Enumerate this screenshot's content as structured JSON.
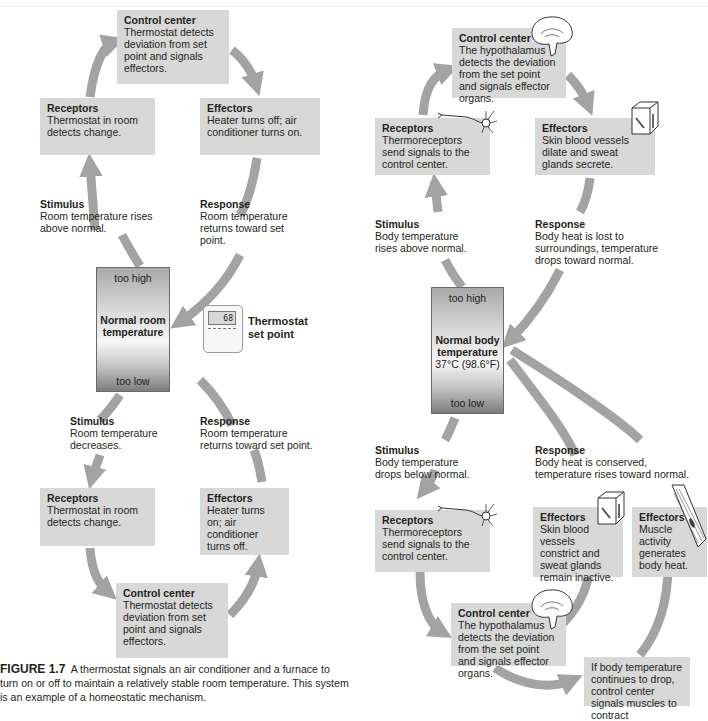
{
  "left_diagram": {
    "top_loop": {
      "control_center": {
        "title": "Control center",
        "text": "Thermostat detects deviation from set point and signals effectors."
      },
      "receptors": {
        "title": "Receptors",
        "text": "Thermostat in room detects change."
      },
      "effectors": {
        "title": "Effectors",
        "text": "Heater turns off; air conditioner turns on."
      },
      "stimulus": {
        "title": "Stimulus",
        "text": "Room temperature rises above normal."
      },
      "response": {
        "title": "Response",
        "text": "Room temperature returns toward set point."
      }
    },
    "gauge": {
      "high": "too high",
      "label_line1": "Normal room",
      "label_line2": "temperature",
      "low": "too low"
    },
    "setpoint": {
      "display": "68",
      "label_line1": "Thermostat",
      "label_line2": "set point"
    },
    "bottom_loop": {
      "stimulus": {
        "title": "Stimulus",
        "text": "Room temperature decreases."
      },
      "response": {
        "title": "Response",
        "text": "Room temperature returns toward set point."
      },
      "receptors": {
        "title": "Receptors",
        "text": "Thermostat in room detects change."
      },
      "effectors": {
        "title": "Effectors",
        "text": "Heater turns on; air conditioner turns off."
      },
      "control_center": {
        "title": "Control center",
        "text": "Thermostat detects deviation from set point and signals effectors."
      }
    }
  },
  "right_diagram": {
    "top_loop": {
      "control_center": {
        "title": "Control center",
        "text": "The hypothalamus detects the deviation from the set point and signals effector organs."
      },
      "receptors": {
        "title": "Receptors",
        "text": "Thermoreceptors send signals to the control center."
      },
      "effectors": {
        "title": "Effectors",
        "text": "Skin blood vessels dilate and sweat glands secrete."
      },
      "stimulus": {
        "title": "Stimulus",
        "text": "Body temperature rises above normal."
      },
      "response": {
        "title": "Response",
        "text": "Body heat is lost to surroundings, temperature drops toward normal."
      }
    },
    "gauge": {
      "high": "too high",
      "label_line1": "Normal body",
      "label_line2": "temperature",
      "value": "37°C (98.6°F)",
      "low": "too low"
    },
    "bottom_loop": {
      "stimulus": {
        "title": "Stimulus",
        "text": "Body temperature drops below normal."
      },
      "response": {
        "title": "Response",
        "text": "Body heat is conserved, temperature rises toward normal."
      },
      "receptors": {
        "title": "Receptors",
        "text": "Thermoreceptors send signals to the control center."
      },
      "effectors_skin": {
        "title": "Effectors",
        "text": "Skin blood vessels constrict and sweat glands remain inactive."
      },
      "effectors_muscle": {
        "title": "Effectors",
        "text": "Muscle activity generates body heat."
      },
      "control_center": {
        "title": "Control center",
        "text": "The hypothalamus detects the deviation from the set point and signals effector organs."
      },
      "note": "If body temperature continues to drop, control center signals muscles to contract"
    }
  },
  "caption": {
    "figure": "FIGURE 1.7",
    "text": "A thermostat signals an air conditioner and a furnace to turn on or off to maintain a relatively stable room temperature. This system is an example of a homeostatic mechanism."
  },
  "colors": {
    "box": "#d8d8d8",
    "arrow": "#a3a3a3",
    "text": "#231f20"
  }
}
